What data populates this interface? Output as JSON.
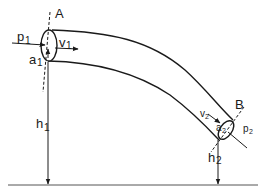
{
  "diagram": {
    "type": "bernoulli-pipe-flow",
    "labels": {
      "section_a": "A",
      "section_b": "B",
      "p1": "p",
      "p1_sub": "1",
      "v1": "v",
      "v1_sub": "1",
      "a1": "a",
      "a1_sub": "1",
      "h1": "h",
      "h1_sub": "1",
      "p2": "p",
      "p2_sub": "2",
      "v2": "v",
      "v2_sub": "2",
      "a2": "a",
      "a2_sub": "2",
      "h2": "h",
      "h2_sub": "2"
    },
    "stroke_color": "#1a1a1a",
    "background": "#ffffff"
  }
}
